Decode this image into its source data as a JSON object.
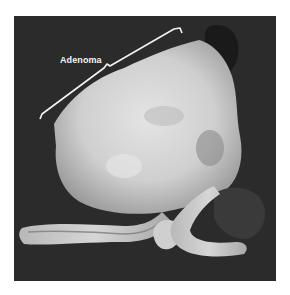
{
  "figure": {
    "annotation_label": "Adenoma",
    "colors": {
      "background": "#ffffff",
      "photo_background": "#2b2b2b",
      "tissue_light": "#d8d8d8",
      "label": "#f4f4f4"
    }
  }
}
